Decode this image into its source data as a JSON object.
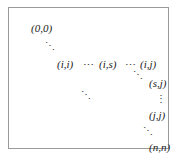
{
  "figure": {
    "type": "index-grid-diagram",
    "border_color": "#9a9a9a",
    "background_color": "#ffffff",
    "text_color": "#1a1a1a",
    "labels": {
      "origin": "(0,0)",
      "row_start": "(i,i)",
      "row_middle": "(i,s)",
      "row_end": "(i,j)",
      "col_s": "(s,j)",
      "col_j": "(j,j)",
      "terminal": "(n,n)"
    },
    "ellipses": {
      "diagonal_down": "⋱",
      "horizontal": "⋯",
      "vertical": "⋮"
    }
  }
}
